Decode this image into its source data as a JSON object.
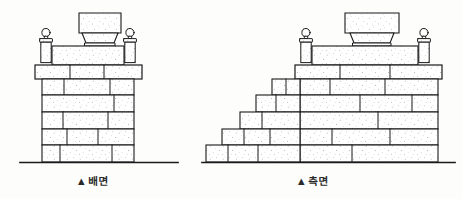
{
  "figure": {
    "type": "architectural-elevation-drawing",
    "style": "ink line drawing with stipple texture",
    "background_color": "#fdfdfc",
    "line_color": "#1a1a1a",
    "stone_fill_color": "#ffffff",
    "stipple_color": "#4a4a4a"
  },
  "views": [
    {
      "id": "rear",
      "caption_marker": "▲",
      "caption_label": "배면",
      "description": "rear elevation",
      "ground_line": {
        "x1": 20,
        "x2": 178,
        "y": 162
      },
      "courses": 6,
      "finial_posts": 2,
      "cap_stones": 1,
      "has_steps": false
    },
    {
      "id": "side",
      "caption_marker": "▲",
      "caption_label": "측면",
      "description": "side elevation",
      "ground_line": {
        "x1": 205,
        "x2": 455,
        "y": 162
      },
      "courses": 6,
      "finial_posts": 2,
      "cap_stones": 1,
      "has_steps": true,
      "step_count": 5
    }
  ],
  "captions": {
    "rear": {
      "marker": "▲",
      "text": "배면"
    },
    "side": {
      "marker": "▲",
      "text": "측면"
    }
  },
  "geometry": {
    "rear": {
      "cap_stone": {
        "x": 78,
        "y": 12,
        "w": 44,
        "h": 22
      },
      "cap_foot": {
        "x": 84,
        "y": 34,
        "w": 32,
        "h": 10
      },
      "left_post": {
        "x": 40,
        "y": 30,
        "w": 14,
        "h": 34
      },
      "right_post": {
        "x": 124,
        "y": 30,
        "w": 14,
        "h": 34
      },
      "plinth_band": {
        "x": 34,
        "y": 64,
        "w": 110,
        "h": 14
      },
      "wall": {
        "x": 42,
        "y": 78,
        "w": 94,
        "h": 84
      }
    },
    "side": {
      "cap_stone": {
        "x": 345,
        "y": 12,
        "w": 54,
        "h": 22
      },
      "cap_foot": {
        "x": 352,
        "y": 34,
        "w": 40,
        "h": 10
      },
      "left_post": {
        "x": 300,
        "y": 30,
        "w": 14,
        "h": 34
      },
      "right_post": {
        "x": 418,
        "y": 30,
        "w": 14,
        "h": 34
      },
      "plinth_band": {
        "x": 294,
        "y": 64,
        "w": 150,
        "h": 14
      },
      "wall": {
        "x": 300,
        "y": 78,
        "w": 140,
        "h": 84
      },
      "steps_origin": {
        "x": 205,
        "y": 162
      }
    }
  }
}
